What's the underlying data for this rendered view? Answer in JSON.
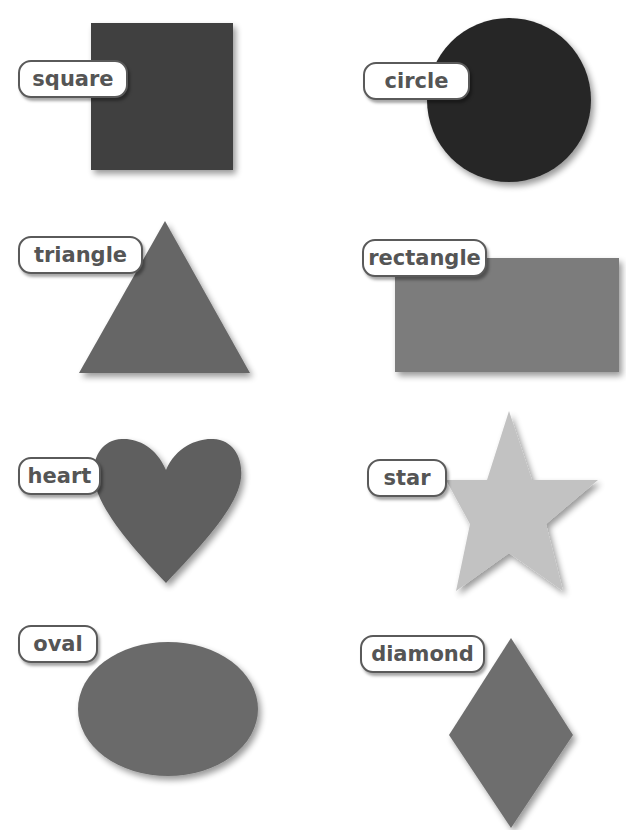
{
  "shapes": [
    {
      "id": "square",
      "label": "square",
      "color": "#404040"
    },
    {
      "id": "circle",
      "label": "circle",
      "color": "#262626"
    },
    {
      "id": "triangle",
      "label": "triangle",
      "color": "#666666"
    },
    {
      "id": "rectangle",
      "label": "rectangle",
      "color": "#7c7c7c"
    },
    {
      "id": "heart",
      "label": "heart",
      "color": "#5e5e5e"
    },
    {
      "id": "star",
      "label": "star",
      "color": "#c2c2c2"
    },
    {
      "id": "oval",
      "label": "oval",
      "color": "#6a6a6a"
    },
    {
      "id": "diamond",
      "label": "diamond",
      "color": "#6e6e6e"
    }
  ]
}
